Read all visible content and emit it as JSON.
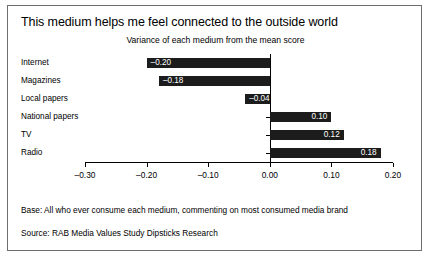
{
  "chart_data": {
    "type": "bar",
    "orientation": "horizontal",
    "title": "This medium helps me feel connected to the outside world",
    "subtitle": "Variance of each medium from the mean score",
    "categories": [
      "Internet",
      "Magazines",
      "Local papers",
      "National papers",
      "TV",
      "Radio"
    ],
    "values": [
      -0.2,
      -0.18,
      -0.04,
      0.1,
      0.12,
      0.18
    ],
    "value_labels": [
      "–0.20",
      "–0.18",
      "–0.04",
      "0.10",
      "0.12",
      "0.18"
    ],
    "xlabel": "",
    "ylabel": "",
    "xlim": [
      -0.3,
      0.2
    ],
    "xticks": [
      -0.3,
      -0.2,
      -0.1,
      0.0,
      0.1,
      0.2
    ],
    "xtick_labels": [
      "–0.30",
      "–0.20",
      "–0.10",
      "0.00",
      "0.10",
      "0.20"
    ],
    "grid": false,
    "legend": false,
    "bar_color": "#1c1c1c",
    "value_label_color": "#ffffff"
  },
  "footnotes": {
    "base": "Base: All who ever consume each medium, commenting on most consumed media brand",
    "source": "Source: RAB Media Values Study Dipsticks Research"
  }
}
